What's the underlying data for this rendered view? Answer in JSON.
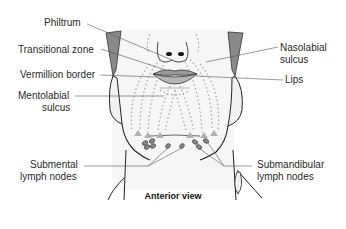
{
  "diagram": {
    "caption": "Anterior view",
    "labels": {
      "philtrum": "Philtrum",
      "transitional_zone": "Transitional zone",
      "vermillion_border": "Vermillion border",
      "mentolabial_sulcus_1": "Mentolabial",
      "mentolabial_sulcus_2": "sulcus",
      "nasolabial_sulcus_1": "Nasolabial",
      "nasolabial_sulcus_2": "sulcus",
      "lips": "Lips",
      "submental_1": "Submental",
      "submental_2": "lymph nodes",
      "submandibular_1": "Submandibular",
      "submandibular_2": "lymph nodes"
    },
    "colors": {
      "outline": "#222222",
      "shading": "#8a8a8a",
      "lips": "#9a9a9a",
      "lymph_path": "#a8a8a8",
      "node_fill": "#8c8c8c",
      "leader": "#555555"
    }
  }
}
